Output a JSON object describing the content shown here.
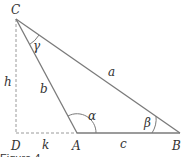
{
  "figure": {
    "caption": "Figure 4",
    "vertices": {
      "C": "C",
      "A": "A",
      "B": "B",
      "D": "D"
    },
    "sides": {
      "a": "a",
      "b": "b",
      "c": "c",
      "h": "h",
      "k": "k"
    },
    "angles": {
      "alpha": "α",
      "beta": "β",
      "gamma": "γ"
    },
    "colors": {
      "line": "#7a7a7a",
      "dashed": "#9a9a9a",
      "text": "#333333"
    }
  }
}
